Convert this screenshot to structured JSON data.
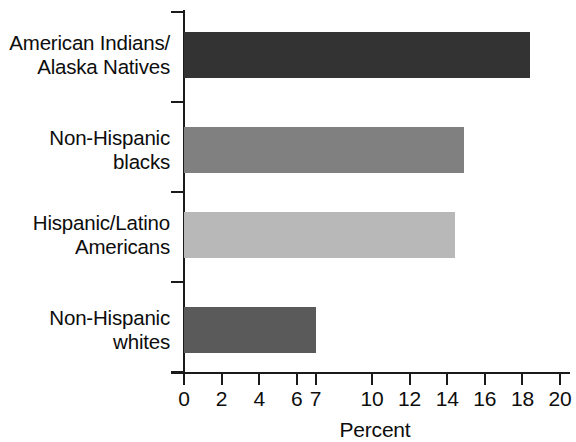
{
  "chart_data": {
    "type": "bar",
    "orientation": "horizontal",
    "title": "",
    "subtitle": "",
    "xlabel": "Percent",
    "ylabel": "",
    "categories": [
      "American Indians/\nAlaska Natives",
      "Non-Hispanic\nblacks",
      "Hispanic/Latino\nAmericans",
      "Non-Hispanic\nwhites"
    ],
    "values": [
      18.4,
      14.9,
      14.4,
      7.0
    ],
    "bar_colors": [
      "#333333",
      "#808080",
      "#b8b8b8",
      "#5a5a5a"
    ],
    "xlim": [
      0,
      20
    ],
    "xticks": [
      0,
      2,
      4,
      6,
      7,
      10,
      12,
      14,
      16,
      18,
      20
    ],
    "xtick_labels": [
      "0",
      "2",
      "4",
      "6",
      "7",
      "10",
      "12",
      "14",
      "16",
      "18",
      "20"
    ],
    "grid": false,
    "legend": false,
    "legend_position": "none",
    "axis_color": "#1a1a1a",
    "background_color": "#ffffff"
  },
  "axes": {
    "x_title": "Percent"
  }
}
